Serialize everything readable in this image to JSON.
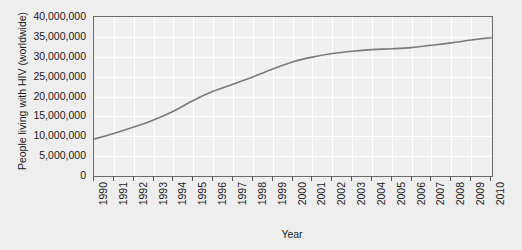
{
  "chart_data": {
    "type": "line",
    "title": "",
    "xlabel": "Year",
    "ylabel": "People living with HIV (worldwide)",
    "grid": true,
    "legend": "none",
    "xlim": [
      1990,
      2010
    ],
    "ylim": [
      0,
      40000000
    ],
    "categories": [
      "1990",
      "1991",
      "1992",
      "1993",
      "1994",
      "1995",
      "1996",
      "1997",
      "1998",
      "1999",
      "2000",
      "2001",
      "2002",
      "2003",
      "2004",
      "2005",
      "2006",
      "2007",
      "2008",
      "2009",
      "2010"
    ],
    "y_tick_labels": [
      "0",
      "5,000,000",
      "10,000,000",
      "15,000,000",
      "20,000,000",
      "25,000,000",
      "30,000,000",
      "35,000,000",
      "40,000,000"
    ],
    "y_tick_values": [
      0,
      5000000,
      10000000,
      15000000,
      20000000,
      25000000,
      30000000,
      35000000,
      40000000
    ],
    "series": [
      {
        "name": "People living with HIV (worldwide)",
        "color": "#7a7a7a",
        "values": [
          9300000,
          10700000,
          12300000,
          14100000,
          16300000,
          19000000,
          21300000,
          23100000,
          24900000,
          26900000,
          28700000,
          29900000,
          30800000,
          31400000,
          31800000,
          32000000,
          32300000,
          32900000,
          33500000,
          34200000,
          34800000
        ]
      }
    ],
    "colors": {
      "line": "#7a7a7a",
      "plot_background": "#f0f0f0",
      "figure_background": "#eeeeee",
      "gridline": "#ffffff",
      "axis": "#6b6b6b",
      "text": "#1a1a1a"
    }
  }
}
